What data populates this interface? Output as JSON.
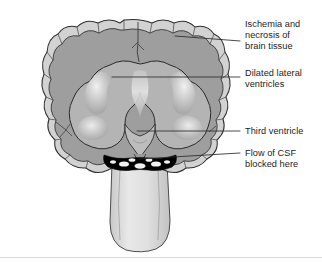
{
  "figure": {
    "background_color": "#ffffff",
    "footer_rule_color": "#d9d9d9",
    "anatomy": {
      "cortex_ribbon_color": "#d2d2d2",
      "brain_tissue_color": "#9e9e9e",
      "ventricle_color": "#b4b4b4",
      "ventricle_highlight_color": "#f2f2f2",
      "brainstem_color": "#dcdcdc",
      "blockage_color": "#000000",
      "outline_color": "#2b2b2b",
      "parts": [
        {
          "name": "cerebral-cortex",
          "label": "Cerebral cortex"
        },
        {
          "name": "lateral-ventricles",
          "label": "Dilated lateral ventricles"
        },
        {
          "name": "third-ventricle",
          "label": "Third ventricle"
        },
        {
          "name": "csf-blockage",
          "label": "Flow of CSF blocked here"
        },
        {
          "name": "brainstem",
          "label": "Brainstem"
        }
      ]
    },
    "labels": [
      {
        "id": "ischemia",
        "text": "Ischemia and\nnecrosis of\nbrain tissue",
        "lines": [
          "Ischemia and",
          "necrosis of",
          "brain tissue"
        ],
        "leader_from": [
          175,
          36
        ],
        "leader_to": [
          240,
          41
        ]
      },
      {
        "id": "lateral_ventricles",
        "text": "Dilated lateral\nventricles",
        "lines": [
          "Dilated lateral",
          "ventricles"
        ],
        "leader_from": [
          112,
          77
        ],
        "leader_to": [
          240,
          77
        ]
      },
      {
        "id": "third_ventricle",
        "text": "Third ventricle",
        "lines": [
          "Third ventricle"
        ],
        "leader_from": [
          137,
          131
        ],
        "leader_to": [
          240,
          131
        ]
      },
      {
        "id": "csf_blocked",
        "text": "Flow of CSF\nblocked here",
        "lines": [
          "Flow of CSF",
          "blocked here"
        ],
        "leader_from": [
          139,
          159
        ],
        "leader_to": [
          240,
          153
        ]
      }
    ]
  }
}
